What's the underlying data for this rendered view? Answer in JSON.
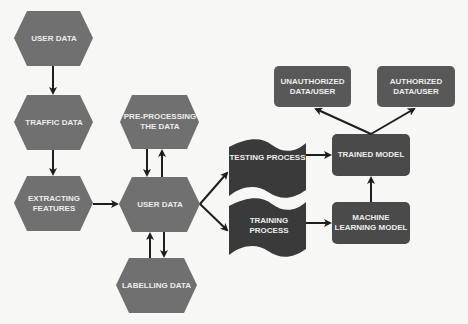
{
  "diagram": {
    "colors": {
      "background": "#f7f7f5",
      "hexagon_fill": "#707070",
      "box_fill": "#505050",
      "wave_fill": "#3a3a3a",
      "arrow": "#1e1e1e",
      "text": "#ececec"
    },
    "nodes": {
      "user_data_top": "USER DATA",
      "traffic_data": "TRAFFIC DATA",
      "extracting_features": "EXTRACTING FEATURES",
      "pre_processing": "PRE-PROCESSING THE DATA",
      "user_data_center": "USER DATA",
      "labelling_data": "LABELLING DATA",
      "testing_process": "TESTING PROCESS",
      "training_process": "TRAINING PROCESS",
      "trained_model": "TRAINED MODEL",
      "machine_learning_model": "MACHINE LEARNING MODEL",
      "unauthorized": "UNAUTHORIZED DATA/USER",
      "authorized": "AUTHORIZED DATA/USER"
    },
    "edges": [
      {
        "from": "USER DATA",
        "to": "TRAFFIC DATA"
      },
      {
        "from": "TRAFFIC DATA",
        "to": "EXTRACTING FEATURES"
      },
      {
        "from": "EXTRACTING FEATURES",
        "to": "USER DATA (center)"
      },
      {
        "from": "PRE-PROCESSING THE DATA",
        "to": "USER DATA (center)"
      },
      {
        "from": "USER DATA (center)",
        "to": "PRE-PROCESSING THE DATA"
      },
      {
        "from": "LABELLING DATA",
        "to": "USER DATA (center)"
      },
      {
        "from": "USER DATA (center)",
        "to": "LABELLING DATA"
      },
      {
        "from": "USER DATA (center)",
        "to": "TESTING PROCESS"
      },
      {
        "from": "USER DATA (center)",
        "to": "TRAINING PROCESS"
      },
      {
        "from": "TESTING PROCESS",
        "to": "TRAINED MODEL"
      },
      {
        "from": "TRAINING PROCESS",
        "to": "MACHINE LEARNING MODEL"
      },
      {
        "from": "MACHINE LEARNING MODEL",
        "to": "TRAINED MODEL"
      },
      {
        "from": "TRAINED MODEL",
        "to": "UNAUTHORIZED DATA/USER"
      },
      {
        "from": "TRAINED MODEL",
        "to": "AUTHORIZED DATA/USER"
      }
    ]
  }
}
